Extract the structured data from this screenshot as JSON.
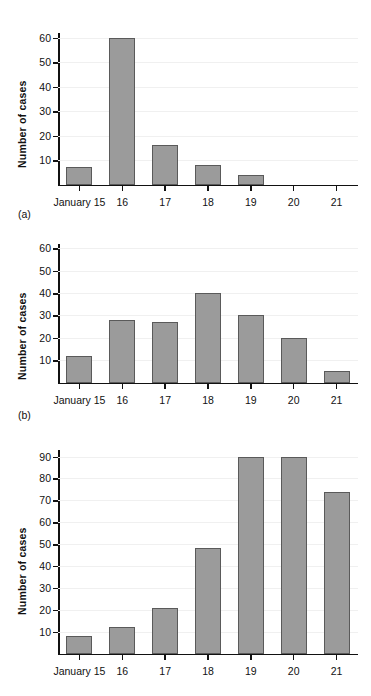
{
  "figure": {
    "panels": [
      {
        "key": "a",
        "label": "(a)",
        "ylabel": "Number of cases",
        "chart_data": {
          "type": "bar",
          "title": "",
          "xlabel": "",
          "ylabel": "Number of cases",
          "categories": [
            "January 15",
            "16",
            "17",
            "18",
            "19",
            "20",
            "21"
          ],
          "values": [
            7,
            60,
            16,
            8,
            4,
            0,
            0
          ],
          "yticks": [
            10,
            20,
            30,
            40,
            50,
            60
          ],
          "ylim": [
            0,
            62
          ],
          "grid": true,
          "legend": null
        }
      },
      {
        "key": "b",
        "label": "(b)",
        "ylabel": "Number of cases",
        "chart_data": {
          "type": "bar",
          "title": "",
          "xlabel": "",
          "ylabel": "Number of cases",
          "categories": [
            "January 15",
            "16",
            "17",
            "18",
            "19",
            "20",
            "21"
          ],
          "values": [
            12,
            28,
            27,
            40,
            30,
            20,
            5
          ],
          "yticks": [
            10,
            20,
            30,
            40,
            50,
            60
          ],
          "ylim": [
            0,
            62
          ],
          "grid": true,
          "legend": null
        }
      },
      {
        "key": "c",
        "label": "",
        "ylabel": "Number of cases",
        "chart_data": {
          "type": "bar",
          "title": "",
          "xlabel": "",
          "ylabel": "Number of cases",
          "categories": [
            "January 15",
            "16",
            "17",
            "18",
            "19",
            "20",
            "21"
          ],
          "values": [
            8,
            12,
            21,
            48,
            90,
            90,
            74
          ],
          "yticks": [
            10,
            20,
            30,
            40,
            50,
            60,
            70,
            80,
            90
          ],
          "ylim": [
            0,
            93
          ],
          "grid": true,
          "legend": null
        }
      }
    ],
    "colors": {
      "bar_fill": "#9b9b9b",
      "bar_stroke": "#5a5a5a",
      "axis": "#111111",
      "grid": "#f0f0f0",
      "background": "#ffffff"
    }
  }
}
